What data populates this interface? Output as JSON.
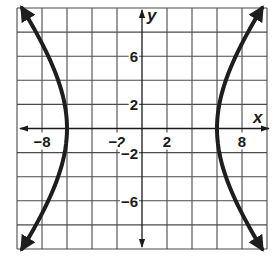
{
  "chart_data": {
    "type": "line",
    "title": "",
    "xlabel": "x",
    "ylabel": "y",
    "xlim": [
      -10,
      10
    ],
    "ylim": [
      -10,
      10
    ],
    "grid": true,
    "grid_step": 2,
    "x_tick_labels": [
      {
        "value": -8,
        "text": "−8"
      },
      {
        "value": -2,
        "text": "−2"
      },
      {
        "value": 2,
        "text": "2"
      },
      {
        "value": 8,
        "text": "8"
      }
    ],
    "y_tick_labels": [
      {
        "value": 6,
        "text": "6"
      },
      {
        "value": 2,
        "text": "2"
      },
      {
        "value": -2,
        "text": "−2"
      },
      {
        "value": -6,
        "text": "−6"
      }
    ],
    "series": [
      {
        "name": "hyperbola-left-branch",
        "equation": "x^2/36 - y^2/64 = 1",
        "a": 6,
        "b": 8,
        "branch": "left",
        "arrows": "both-ends",
        "points": [
          [
            -9.6,
            10
          ],
          [
            -7.5,
            6
          ],
          [
            -6.7,
            4
          ],
          [
            -6.2,
            2
          ],
          [
            -6,
            0
          ],
          [
            -6.2,
            -2
          ],
          [
            -6.7,
            -4
          ],
          [
            -7.5,
            -6
          ],
          [
            -9.6,
            -10
          ]
        ]
      },
      {
        "name": "hyperbola-right-branch",
        "equation": "x^2/36 - y^2/64 = 1",
        "a": 6,
        "b": 8,
        "branch": "right",
        "arrows": "both-ends",
        "points": [
          [
            9.6,
            10
          ],
          [
            7.5,
            6
          ],
          [
            6.7,
            4
          ],
          [
            6.2,
            2
          ],
          [
            6,
            0
          ],
          [
            6.2,
            -2
          ],
          [
            6.7,
            -4
          ],
          [
            7.5,
            -6
          ],
          [
            9.6,
            -10
          ]
        ]
      }
    ],
    "colors": {
      "curve": "#1e1e1e",
      "grid": "#4a4a4a",
      "background": "#ffffff"
    }
  }
}
